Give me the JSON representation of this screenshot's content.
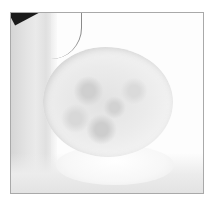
{
  "image": {
    "subject": "white fluffy pom-pom on a light cloth",
    "frame_color": "#a9a9a9",
    "background_color": "#ffffff",
    "accent_dark": "#1b1b1b"
  }
}
